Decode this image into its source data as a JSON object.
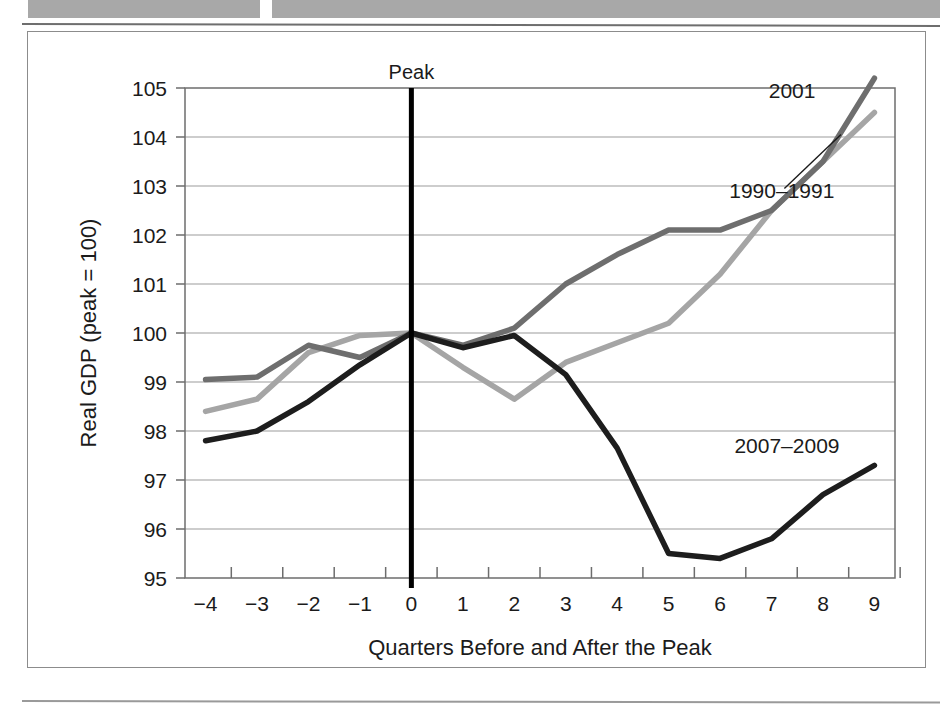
{
  "figure": {
    "top_bars": [
      "header-bar-left",
      "header-bar-right"
    ]
  },
  "chart_data": {
    "type": "line",
    "title": "",
    "xlabel": "Quarters Before and After the Peak",
    "ylabel": "Real GDP (peak = 100)",
    "x": [
      -4,
      -3,
      -2,
      -1,
      0,
      1,
      2,
      3,
      4,
      5,
      6,
      7,
      8,
      9
    ],
    "xtick_labels": [
      "−4",
      "−3",
      "−2",
      "−1",
      "0",
      "1",
      "2",
      "3",
      "4",
      "5",
      "6",
      "7",
      "8",
      "9"
    ],
    "xlim": [
      -4.4,
      9.4
    ],
    "ylim": [
      95,
      105
    ],
    "ytick_labels": [
      "105",
      "104",
      "103",
      "102",
      "101",
      "100",
      "99",
      "98",
      "97",
      "96",
      "95"
    ],
    "yticks": [
      105,
      104,
      103,
      102,
      101,
      100,
      99,
      98,
      97,
      96,
      95
    ],
    "grid": "horizontal",
    "legend_position": "inline-labels",
    "annotations": [
      {
        "text": "Peak",
        "x": 0,
        "note": "vertical reference line at quarter 0"
      }
    ],
    "series": [
      {
        "name": "1990–1991",
        "color": "#a5a5a5",
        "label_x": 7.2,
        "label_y": 102.75,
        "values": [
          98.4,
          98.65,
          99.6,
          99.95,
          100.0,
          99.3,
          98.65,
          99.4,
          99.8,
          100.2,
          101.2,
          102.5,
          103.5,
          104.5
        ]
      },
      {
        "name": "2001",
        "color": "#6e6e6e",
        "label_x": 7.4,
        "label_y": 104.8,
        "values": [
          99.05,
          99.1,
          99.75,
          99.5,
          100.0,
          99.75,
          100.1,
          101.0,
          101.6,
          102.1,
          102.1,
          102.5,
          103.5,
          105.2
        ]
      },
      {
        "name": "2007–2009",
        "color": "#1d1d1d",
        "label_x": 7.3,
        "label_y": 97.55,
        "values": [
          97.8,
          98.0,
          98.6,
          99.35,
          100.0,
          99.7,
          99.95,
          99.15,
          97.65,
          95.5,
          95.4,
          95.8,
          96.7,
          97.3
        ]
      }
    ]
  }
}
